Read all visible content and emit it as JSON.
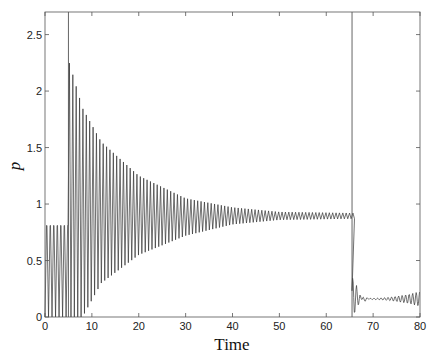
{
  "chart_data": {
    "type": "line",
    "title": "",
    "xlabel": "Time",
    "ylabel": "p",
    "xlim": [
      0,
      80
    ],
    "ylim": [
      0,
      2.7
    ],
    "grid": false,
    "legend": null,
    "xticks": [
      0,
      10,
      20,
      30,
      40,
      50,
      60,
      70,
      80
    ],
    "yticks": [
      0,
      0.5,
      1,
      1.5,
      2,
      2.5
    ],
    "ytick_labels": [
      "0",
      "0.5",
      "1",
      "1.5",
      "2",
      "2.5"
    ],
    "vertical_lines": [
      5.0,
      65.5
    ],
    "series": [
      {
        "name": "p(t)",
        "description": "Spiking oscillation: regular peaks ~0.8 before t=5; after t=5 peaks jump to ~2.25 and decay toward ~0.92 while trough baseline rises from 0 to ~0.85 by t~45; after t=65.5 damped oscillation around ~0.15 with growing small oscillations toward t=80",
        "segments": [
          {
            "t_range": [
              0,
              5
            ],
            "period": 0.75,
            "peak": 0.81,
            "trough": 0.0
          },
          {
            "t_range": [
              5,
              65.5
            ],
            "period": 0.72,
            "peak_envelope": [
              [
                5.2,
                2.25
              ],
              [
                8,
                1.85
              ],
              [
                12,
                1.55
              ],
              [
                20,
                1.25
              ],
              [
                30,
                1.05
              ],
              [
                40,
                0.97
              ],
              [
                50,
                0.93
              ],
              [
                65.5,
                0.92
              ]
            ],
            "trough_envelope": [
              [
                5,
                0.0
              ],
              [
                8,
                0.0
              ],
              [
                12,
                0.3
              ],
              [
                20,
                0.55
              ],
              [
                30,
                0.72
              ],
              [
                40,
                0.82
              ],
              [
                50,
                0.86
              ],
              [
                65.5,
                0.87
              ]
            ]
          },
          {
            "t_range": [
              65.5,
              80
            ],
            "description": "damped oscillation to ~0.16, then growing oscillation amplitude ~0.1 near t=80",
            "points": [
              [
                65.5,
                0.4
              ],
              [
                66,
                0.05
              ],
              [
                66.5,
                0.33
              ],
              [
                67,
                0.08
              ],
              [
                67.5,
                0.25
              ],
              [
                68,
                0.12
              ],
              [
                69,
                0.18
              ],
              [
                70,
                0.15
              ],
              [
                72,
                0.16
              ],
              [
                74,
                0.15
              ],
              [
                76,
                0.17
              ],
              [
                78,
                0.2
              ],
              [
                80,
                0.24
              ]
            ]
          }
        ]
      }
    ]
  }
}
